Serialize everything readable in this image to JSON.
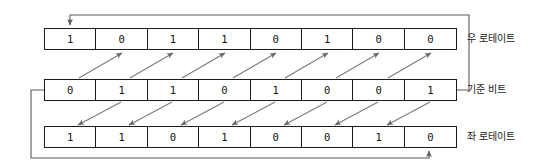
{
  "diagram": {
    "stroke_color": "#1c1c1c",
    "arrow_color": "#6b6b6b",
    "background": "#ffffff",
    "rows": [
      {
        "id": "right-rotate",
        "label": "우 로테이트",
        "bits": [
          "1",
          "0",
          "1",
          "1",
          "0",
          "1",
          "0",
          "0"
        ]
      },
      {
        "id": "reference",
        "label": "기준 비트",
        "bits": [
          "0",
          "1",
          "1",
          "0",
          "1",
          "0",
          "0",
          "1"
        ]
      },
      {
        "id": "left-rotate",
        "label": "좌 로테이트",
        "bits": [
          "1",
          "1",
          "0",
          "1",
          "0",
          "0",
          "1",
          "0"
        ]
      }
    ],
    "connectors": {
      "right_rotate_wrap": "from right end of reference row, around the right side and over the top, arrow pointing down into first cell of right-rotate row",
      "left_rotate_wrap": "from left end of reference row, around the left side and under the bottom, arrow pointing up into last cell of left-rotate row",
      "up_arrow_count": 7,
      "down_arrow_count": 7
    }
  }
}
